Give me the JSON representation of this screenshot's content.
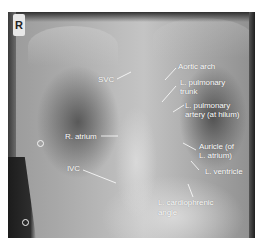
{
  "image": {
    "description": "Posteroanterior chest X-ray with anatomical labels",
    "side_marker": "R",
    "colors": {
      "label_text": "#ffffff",
      "leader_line": "#ffffff",
      "border": "#1e1e1e"
    }
  },
  "labels": {
    "svc": "SVC",
    "aortic_arch": "Aortic arch",
    "l_pulmonary_trunk_1": "L. pulmonary",
    "l_pulmonary_trunk_2": "trunk",
    "l_pulmonary_artery_1": "L. pulmonary",
    "l_pulmonary_artery_2": "artery (at hilum)",
    "r_atrium": "R. atrium",
    "auricle_1": "Auricle (of",
    "auricle_2": "L. atrium)",
    "ivc": "IVC",
    "l_ventricle": "L. ventricle",
    "l_cardiophrenic_1": "L. cardiophrenic",
    "l_cardiophrenic_2": "angle"
  }
}
